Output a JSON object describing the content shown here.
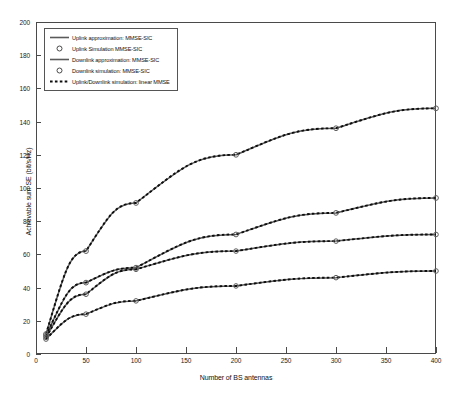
{
  "chart_data": {
    "type": "line",
    "title": "",
    "xlabel": "Number of BS antennas",
    "ylabel": "Achievable sum SE (bit/s/Hz)",
    "xlim": [
      0,
      400
    ],
    "ylim": [
      0,
      200
    ],
    "xticks": [
      0,
      50,
      100,
      150,
      200,
      250,
      300,
      350,
      400
    ],
    "yticks": [
      0,
      20,
      40,
      60,
      80,
      100,
      120,
      140,
      160,
      180,
      200
    ],
    "grid": false,
    "legend_position": "upper-left",
    "marker_x": [
      10,
      50,
      100,
      200,
      300,
      400
    ],
    "series": [
      {
        "name": "Uplink approximation: MMSE-SIC",
        "style": "solid",
        "color": "#3a3a3a",
        "x": [
          10,
          50,
          100,
          200,
          300,
          400
        ],
        "values": [
          12,
          62,
          91,
          120,
          136,
          148
        ]
      },
      {
        "name": "Uplink Simulation MMSE-SIC",
        "style": "circle-markers",
        "color": "#3a3a3a",
        "x": [
          10,
          50,
          100,
          200,
          300,
          400
        ],
        "values": [
          12,
          62,
          91,
          120,
          136,
          148
        ]
      },
      {
        "name": "Downlink approximation: MMSE-SIC",
        "style": "solid",
        "color": "#3a3a3a",
        "x": [
          10,
          50,
          100,
          200,
          300,
          400
        ],
        "values": [
          11,
          43,
          52,
          72,
          85,
          94
        ]
      },
      {
        "name": "Downlink simulation: MMSE-SIC",
        "style": "circle-markers",
        "color": "#3a3a3a",
        "x": [
          10,
          50,
          100,
          200,
          300,
          400
        ],
        "values": [
          11,
          43,
          52,
          72,
          85,
          94
        ]
      },
      {
        "name": "Uplink/Downlink simulation: linear MMSE",
        "style": "dashed",
        "color": "#111111",
        "x": [
          10,
          50,
          100,
          200,
          300,
          400
        ],
        "values": [
          10,
          36,
          51,
          62,
          68,
          72
        ]
      },
      {
        "name": "Uplink/Downlink simulation: linear MMSE (lower)",
        "style": "dashed",
        "color": "#111111",
        "x": [
          10,
          50,
          100,
          200,
          300,
          400
        ],
        "values": [
          9,
          24,
          32,
          41,
          46,
          50
        ]
      }
    ]
  },
  "legend": {
    "entries": [
      {
        "label": "Uplink approximation: MMSE-SIC",
        "symbol": "solid-line"
      },
      {
        "label": "Uplink Simulation MMSE-SIC",
        "symbol": "circle-marker"
      },
      {
        "label": "Downlink approximation: MMSE-SIC",
        "symbol": "solid-line"
      },
      {
        "label": "Downlink simulation: MMSE-SIC",
        "symbol": "circle-marker"
      },
      {
        "label": "Uplink/Downlink simulation: linear MMSE",
        "symbol": "dashed-line"
      }
    ]
  }
}
